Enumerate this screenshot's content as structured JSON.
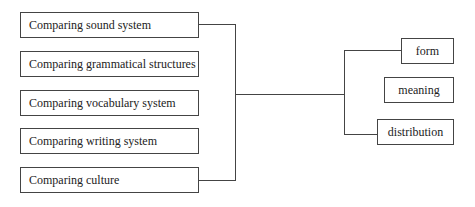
{
  "diagram": {
    "left_items": [
      {
        "label": "Comparing sound system"
      },
      {
        "label": "Comparing grammatical structures"
      },
      {
        "label": "Comparing vocabulary system"
      },
      {
        "label": "Comparing writing system"
      },
      {
        "label": "Comparing culture"
      }
    ],
    "right_items": [
      {
        "label": "form"
      },
      {
        "label": "meaning"
      },
      {
        "label": "distribution"
      }
    ],
    "colors": {
      "line": "#444444",
      "background": "#ffffff",
      "text": "#222222"
    }
  }
}
